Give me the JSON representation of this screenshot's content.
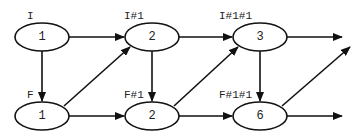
{
  "diagram": {
    "type": "directed-graph",
    "nodes": [
      {
        "id": "I",
        "label": "I",
        "value": "1"
      },
      {
        "id": "I#1",
        "label": "I#1",
        "value": "2"
      },
      {
        "id": "I#1#1",
        "label": "I#1#1",
        "value": "3"
      },
      {
        "id": "F",
        "label": "F",
        "value": "1"
      },
      {
        "id": "F#1",
        "label": "F#1",
        "value": "2"
      },
      {
        "id": "F#1#1",
        "label": "F#1#1",
        "value": "6"
      }
    ],
    "edges": [
      {
        "from": "I",
        "to": "I#1"
      },
      {
        "from": "I",
        "to": "F"
      },
      {
        "from": "F",
        "to": "I#1"
      },
      {
        "from": "F",
        "to": "F#1"
      },
      {
        "from": "I#1",
        "to": "I#1#1"
      },
      {
        "from": "I#1",
        "to": "F#1"
      },
      {
        "from": "F#1",
        "to": "I#1#1"
      },
      {
        "from": "F#1",
        "to": "F#1#1"
      },
      {
        "from": "I#1#1",
        "to": "F#1#1"
      },
      {
        "from": "I#1#1",
        "to": "(out)"
      },
      {
        "from": "F#1#1",
        "to": "(out-diagonal)"
      },
      {
        "from": "F#1#1",
        "to": "(out)"
      }
    ]
  }
}
